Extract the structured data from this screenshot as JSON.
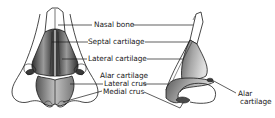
{
  "diagram": {
    "views": [
      {
        "id": "front",
        "name": "front-view"
      },
      {
        "id": "side",
        "name": "side-view"
      }
    ],
    "labels": {
      "nasal_bone": "Nasal bone",
      "septal_cartilage": "Septal cartilage",
      "lateral_cartilage": "Lateral cartilage",
      "alar_cartilage": "Alar cartilage",
      "lateral_crus": "Lateral crus",
      "medial_crus": "Medial crus",
      "alar_cartilage_side_line1": "Alar",
      "alar_cartilage_side_line2": "cartilage"
    },
    "colors": {
      "ink": "#1a1a1a",
      "cartilage_dark": "#3a3a3a",
      "cartilage_mid": "#8a8a8a",
      "cartilage_light": "#d6d6d6",
      "background": "#ffffff"
    }
  }
}
